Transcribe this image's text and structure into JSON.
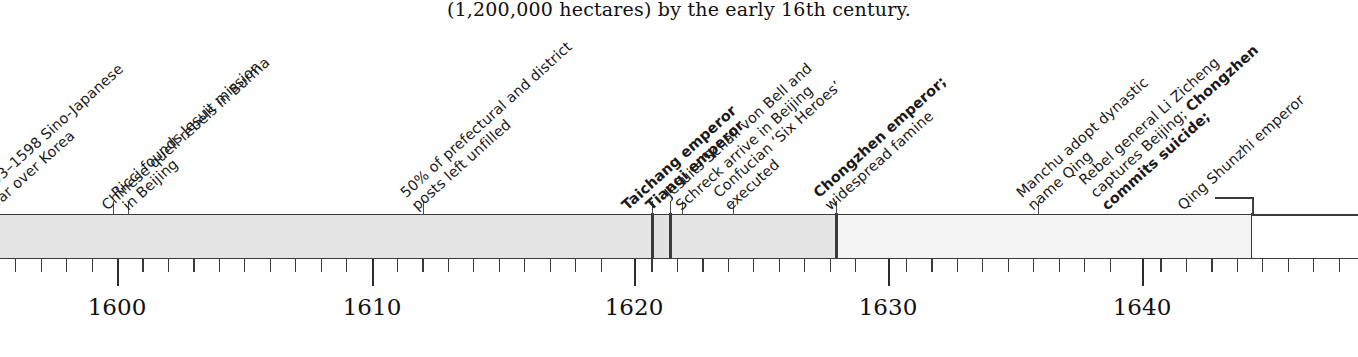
{
  "caption": "(1,200,000 hectares) by the early 16th century.",
  "axis": {
    "year_labels": [
      {
        "year": 1600,
        "text": "1600",
        "x": 117
      },
      {
        "year": 1610,
        "text": "1610",
        "x": 372
      },
      {
        "year": 1620,
        "text": "1620",
        "x": 634
      },
      {
        "year": 1630,
        "text": "1630",
        "x": 888
      },
      {
        "year": 1640,
        "text": "1640",
        "x": 1142
      }
    ],
    "minor_tick_years": [
      1594,
      1595,
      1596,
      1597,
      1598,
      1599,
      1601,
      1602,
      1603,
      1604,
      1605,
      1606,
      1607,
      1608,
      1609,
      1611,
      1612,
      1613,
      1614,
      1615,
      1616,
      1617,
      1618,
      1619,
      1621,
      1622,
      1623,
      1624,
      1625,
      1626,
      1627,
      1628,
      1629,
      1631,
      1632,
      1633,
      1634,
      1635,
      1636,
      1637,
      1638,
      1639,
      1641,
      1642,
      1643,
      1644,
      1645,
      1646,
      1647,
      1648,
      1649
    ],
    "range_start": 1593.5,
    "range_end": 1650.0,
    "px_per_year": 25.45,
    "origin_px": 117
  },
  "band": {
    "top_y": 215,
    "height": 43,
    "segments": [
      {
        "name": "Wanli reign",
        "x": 0,
        "w": 652,
        "fill": "#e4e4e4",
        "left_edge": false,
        "right_edge": true
      },
      {
        "name": "Taichang reign",
        "x": 652,
        "w": 18,
        "fill": "#e1e1e1",
        "left_edge": true,
        "right_edge": true
      },
      {
        "name": "Tianqi reign",
        "x": 670,
        "w": 166,
        "fill": "#e4e4e4",
        "left_edge": true,
        "right_edge": true
      },
      {
        "name": "Chongzhen reign",
        "x": 836,
        "w": 416,
        "fill": "#f3f3f3",
        "left_edge": true,
        "right_edge": true
      }
    ],
    "bracket": {
      "x": 1215,
      "w": 38,
      "rise": 17
    }
  },
  "events": [
    {
      "id": "sino-japanese-war",
      "tick_x": null,
      "label_x": -4,
      "label_y": 214,
      "lines": [
        {
          "text": "1593–1598 Sino-Japanese",
          "bold": false
        },
        {
          "text": "war over Korea",
          "bold": false
        }
      ]
    },
    {
      "id": "burma-rebels",
      "tick_x": 113,
      "label_x": 110,
      "label_y": 214,
      "lines": [
        {
          "text": "Chinese quell rebels in Burma",
          "bold": false
        }
      ]
    },
    {
      "id": "ricci-jesuit-mission",
      "tick_x": 128,
      "label_x": 131,
      "label_y": 214,
      "lines": [
        {
          "text": "Ricci founds Jesuit mission",
          "bold": false
        },
        {
          "text": "in Beijing",
          "bold": false
        }
      ]
    },
    {
      "id": "posts-unfilled",
      "tick_x": 423,
      "label_x": 420,
      "label_y": 214,
      "lines": [
        {
          "text": "50% of prefectural and district",
          "bold": false
        },
        {
          "text": "posts left unfilled",
          "bold": false
        }
      ]
    },
    {
      "id": "taichang-emperor",
      "tick_x": 652,
      "label_x": 630,
      "label_y": 214,
      "lines": [
        {
          "text": "Taichang emperor",
          "bold": true
        }
      ]
    },
    {
      "id": "tianqi-emperor",
      "tick_x": 670,
      "label_x": 654,
      "label_y": 214,
      "lines": [
        {
          "text": "Tianqi emperor",
          "bold": true
        }
      ]
    },
    {
      "id": "jesuits-schall-schreck",
      "tick_x": 682,
      "label_x": 684,
      "label_y": 214,
      "lines": [
        {
          "text": "Jesuits Schall von Bell and",
          "bold": false
        },
        {
          "text": "Schreck arrive in Beijing",
          "bold": false
        }
      ]
    },
    {
      "id": "confucian-six-heroes",
      "tick_x": 733,
      "label_x": 733,
      "label_y": 214,
      "lines": [
        {
          "text": "Confucian ‘Six Heroes’",
          "bold": false
        },
        {
          "text": "executed",
          "bold": false
        }
      ]
    },
    {
      "id": "chongzhen-famine",
      "tick_x": 836,
      "label_x": 833,
      "label_y": 214,
      "lines": [
        {
          "text": "Chongzhen emperor;",
          "bold": true
        },
        {
          "text": "widespread famine",
          "bold": false
        }
      ]
    },
    {
      "id": "manchu-qing-name",
      "tick_x": 1038,
      "label_x": 1036,
      "label_y": 214,
      "lines": [
        {
          "text": "Manchu adopt dynastic",
          "bold": false
        },
        {
          "text": "name Qing",
          "bold": false
        }
      ]
    },
    {
      "id": "li-zicheng-captures-beijing",
      "tick_x": null,
      "label_x": 1110,
      "label_y": 214,
      "lines": [
        {
          "text": "Rebel general Li Zicheng",
          "bold": false
        },
        {
          "text": "captures Beijing; ",
          "bold": false,
          "bold_tail": "Chongzhen"
        },
        {
          "text": "commits suicide;",
          "bold": true
        }
      ]
    },
    {
      "id": "qing-shunzhi-emperor",
      "tick_x": 1252,
      "label_x": 1186,
      "label_y": 214,
      "lines": [
        {
          "text": "Qing Shunzhi emperor",
          "bold": false
        }
      ]
    }
  ],
  "colors": {
    "ink": "#1a1a1a",
    "rule": "#3a3a3a",
    "band_dark": "#e4e4e4",
    "band_light": "#f3f3f3",
    "page": "#ffffff"
  }
}
